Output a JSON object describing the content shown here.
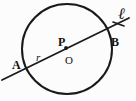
{
  "figure": {
    "kind": "circle-with-secant-line",
    "background_color": "#fcfcfc",
    "stroke_color": "#1a1a1a",
    "width": 136,
    "height": 101,
    "circle": {
      "center_x": 67,
      "center_y": 49,
      "radius": 45,
      "stroke_width": 2.0,
      "fill": "none"
    },
    "line": {
      "name": "secant-line-l",
      "x1": 2,
      "y1": 80,
      "x2": 129,
      "y2": 18,
      "stroke_width": 1.8
    },
    "center_dot": {
      "cx": 66,
      "cy": 48,
      "r": 1.9
    },
    "tick_mark": {
      "x1": 113,
      "y1": 22,
      "x2": 124,
      "y2": 26,
      "stroke_width": 1.6
    },
    "labels": {
      "point_a": "A",
      "point_b": "B",
      "point_p": "P",
      "point_o": "O",
      "radius_r": "r",
      "line_l": "ℓ"
    }
  }
}
